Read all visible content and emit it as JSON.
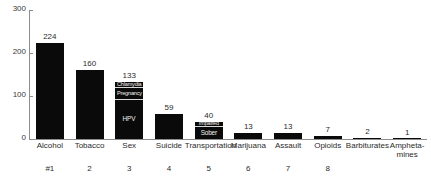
{
  "chart_data": {
    "type": "bar",
    "title": "",
    "subtitle": "",
    "xlabel": "",
    "ylabel": "",
    "ylim": [
      0,
      300
    ],
    "yticks": [
      0,
      100,
      200,
      300
    ],
    "grid": false,
    "legend": "none",
    "bar_color": "#0a0a0a",
    "categories": [
      "Alcohol",
      "Tobacco",
      "Sex",
      "Suicide",
      "Transportation",
      "Marijuana",
      "Assault",
      "Opioids",
      "Barbiturates",
      "Amphetamines"
    ],
    "category_display": [
      "Alcohol",
      "Tobacco",
      "Sex",
      "Suicide",
      "Transportation",
      "Marijuana",
      "Assault",
      "Opioids",
      "Barbiturates",
      "Amphetа-\nmines"
    ],
    "values": [
      224,
      160,
      133,
      59,
      40,
      13,
      13,
      7,
      2,
      1
    ],
    "value_labels": [
      "224",
      "160",
      "133",
      "59",
      "40",
      "13",
      "13",
      "7",
      "2",
      "1"
    ],
    "ranks": [
      "#1",
      "2",
      "3",
      "4",
      "5",
      "6",
      "7",
      "8"
    ],
    "stacked_segments": {
      "Sex": [
        {
          "label": "Chlamydia",
          "value": 13
        },
        {
          "label": "Pregnancy",
          "value": 27
        },
        {
          "label": "HPV",
          "value": 93
        }
      ],
      "Transportation": [
        {
          "label": "Impaired",
          "value": 9
        },
        {
          "label": "Sober",
          "value": 31
        }
      ]
    }
  }
}
